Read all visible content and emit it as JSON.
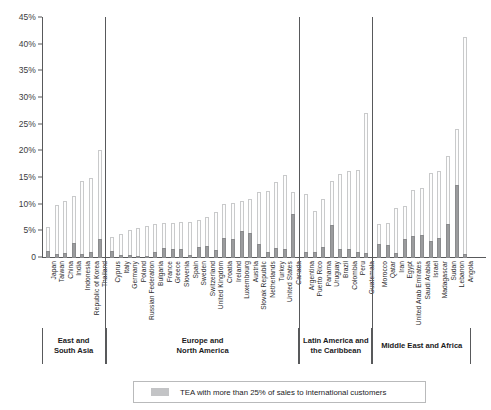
{
  "chart_data": {
    "type": "bar",
    "title": "",
    "xlabel": "",
    "ylabel": "",
    "ylim": [
      0,
      45
    ],
    "grid": false,
    "stacked": true,
    "legend_position": "bottom",
    "ytick_labels": [
      "0",
      "5%",
      "10%",
      "15%",
      "20%",
      "25%",
      "30%",
      "35%",
      "40%",
      "45%"
    ],
    "ytick_values": [
      0,
      5,
      10,
      15,
      20,
      25,
      30,
      35,
      40,
      45
    ],
    "legend": [
      {
        "key": "international",
        "label": "TEA with more than 25% of sales to international customers",
        "color": "#9b9c9e"
      }
    ],
    "series": [
      {
        "name": "TEA total",
        "color": "#fdfdfd",
        "border": "#c9cacb"
      },
      {
        "name": "TEA with more than 25% of sales to international customers",
        "color": "#9b9c9e"
      }
    ],
    "groups": [
      {
        "label": "East and\nSouth Asia",
        "label_line1": "East and",
        "label_line2": "South Asia",
        "categories": [
          "Japan",
          "Taiwan",
          "China",
          "India",
          "Indonesia",
          "Republic of Korea",
          "Thailand"
        ],
        "total": [
          5.6,
          9.7,
          10.5,
          11.5,
          14.2,
          14.9,
          20.0
        ],
        "international": [
          1.3,
          0.8,
          0.9,
          2.9,
          0.7,
          1.2,
          3.6
        ]
      },
      {
        "label": "Europe and\nNorth America",
        "label_line1": "Europe and",
        "label_line2": "North America",
        "categories": [
          "Cyprus",
          "Italy",
          "Germany",
          "Poland",
          "Russian Federation",
          "Bulgaria",
          "France",
          "Greece",
          "Slovenia",
          "Spain",
          "Sweden",
          "Switzerland",
          "United Kingdom",
          "Croatia",
          "Ireland",
          "Luxembourg",
          "Austria",
          "Slovak Republic",
          "Netherlands",
          "Turkey",
          "United States",
          "Canada"
        ],
        "total": [
          3.8,
          4.3,
          5.0,
          5.4,
          5.8,
          6.2,
          6.4,
          6.4,
          6.5,
          6.5,
          6.9,
          7.5,
          8.5,
          10.0,
          10.1,
          10.5,
          10.8,
          12.1,
          12.3,
          14.1,
          15.4,
          12.2
        ],
        "international": [
          1.3,
          0.5,
          0.6,
          0.2,
          0.3,
          1.2,
          1.8,
          1.7,
          1.6,
          0.5,
          2.1,
          2.2,
          1.5,
          3.7,
          3.5,
          5.1,
          4.6,
          2.6,
          1.1,
          1.8,
          1.7,
          8.2
        ]
      },
      {
        "label": "Latin America and\nthe Caribbean",
        "label_line1": "Latin America and",
        "label_line2": "the Caribbean",
        "categories": [
          "Argentina",
          "Puerto Rico",
          "Panama",
          "Uruguay",
          "Brazil",
          "Colombia",
          "Peru",
          "Guatemala"
        ],
        "total": [
          11.8,
          8.6,
          10.8,
          14.3,
          15.5,
          16.2,
          16.4,
          27.0
        ],
        "international": [
          1.1,
          1.1,
          2.0,
          6.1,
          1.6,
          1.6,
          1.2,
          0.9
        ]
      },
      {
        "label": "Middle East and Africa",
        "label_line1": "Middle East and Africa",
        "label_line2": "",
        "categories": [
          "Morocco",
          "Qatar",
          "Iran",
          "Egypt",
          "United Arab Emirates",
          "Saudi Arabia",
          "Israel",
          "Madagascar",
          "Sudan",
          "Lebanon",
          "Angola"
        ],
        "total": [
          6.1,
          6.4,
          9.1,
          9.6,
          12.6,
          12.9,
          15.7,
          16.2,
          18.9,
          24.0,
          41.3
        ],
        "international": [
          2.6,
          2.5,
          1.0,
          3.6,
          4.2,
          4.3,
          3.1,
          3.8,
          6.4,
          13.7,
          0.8
        ]
      }
    ]
  }
}
